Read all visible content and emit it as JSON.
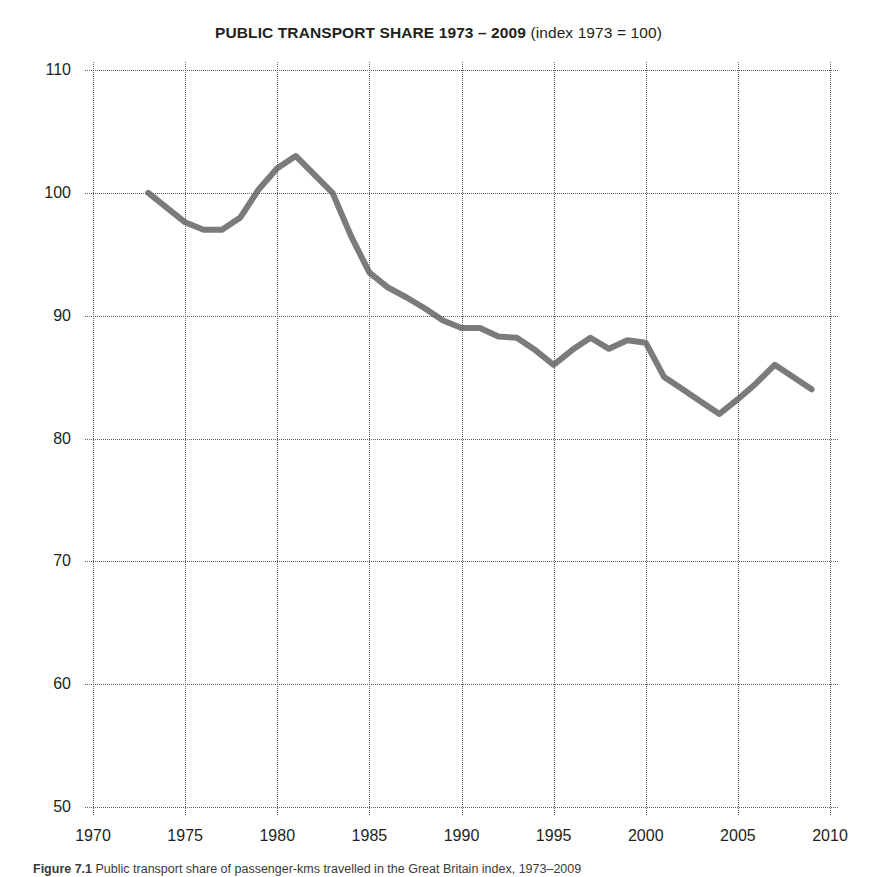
{
  "title": {
    "main": "PUBLIC TRANSPORT SHARE 1973 – 2009",
    "sub": " (index 1973 = 100)"
  },
  "caption": {
    "label": "Figure 7.1",
    "text": " Public transport share of passenger-kms travelled in the Great Britain index, 1973–2009"
  },
  "style": {
    "line_color": "#7b7b7b",
    "grid_color": "#5f5f5f",
    "text_color": "#231f20",
    "background": "#ffffff"
  },
  "chart_data": {
    "type": "line",
    "title": "PUBLIC TRANSPORT SHARE 1973 – 2009 (index 1973 = 100)",
    "xlabel": "",
    "ylabel": "",
    "xlim": [
      1970,
      2010
    ],
    "ylim": [
      50,
      110
    ],
    "xticks": [
      1970,
      1975,
      1980,
      1985,
      1990,
      1995,
      2000,
      2005,
      2010
    ],
    "yticks": [
      50,
      60,
      70,
      80,
      90,
      100,
      110
    ],
    "grid": "dotted-both-axes",
    "legend": "none",
    "series": [
      {
        "name": "Public transport share (index 1973 = 100)",
        "color": "#7b7b7b",
        "x": [
          1973,
          1974,
          1975,
          1976,
          1977,
          1978,
          1979,
          1980,
          1981,
          1982,
          1983,
          1984,
          1985,
          1986,
          1987,
          1988,
          1989,
          1990,
          1991,
          1992,
          1993,
          1994,
          1995,
          1996,
          1997,
          1998,
          1999,
          2000,
          2001,
          2002,
          2003,
          2004,
          2005,
          2006,
          2007,
          2008,
          2009
        ],
        "values": [
          100.0,
          98.8,
          97.6,
          97.0,
          97.0,
          98.0,
          100.3,
          102.0,
          103.0,
          101.5,
          100.0,
          96.5,
          93.5,
          92.3,
          91.5,
          90.6,
          89.6,
          89.0,
          89.0,
          88.3,
          88.2,
          87.2,
          86.0,
          87.2,
          88.2,
          87.3,
          88.0,
          87.8,
          85.0,
          84.0,
          83.0,
          82.0,
          83.2,
          84.5,
          86.0,
          85.0,
          84.0
        ]
      }
    ]
  }
}
